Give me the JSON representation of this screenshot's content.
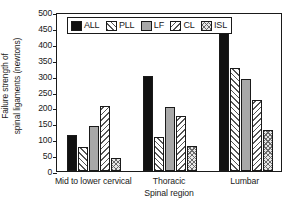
{
  "chart_data": {
    "type": "bar",
    "title": "",
    "xlabel": "Spinal region",
    "ylabel": "Failure strength of spinal ligaments (newtons)",
    "ylabel_lines": [
      "Failure strength of",
      "spinal ligaments (newtons)"
    ],
    "categories": [
      "Mid to lower cervical",
      "Thoracic",
      "Lumbar"
    ],
    "series": [
      {
        "name": "ALL",
        "values": [
          113,
          298,
          450
        ],
        "fill": "solid-black",
        "color": "#111111"
      },
      {
        "name": "PLL",
        "values": [
          75,
          108,
          325
        ],
        "fill": "forward-diagonal-hatch",
        "color": "#ffffff"
      },
      {
        "name": "LF",
        "values": [
          140,
          202,
          288
        ],
        "fill": "solid-gray",
        "color": "#a8a8a8"
      },
      {
        "name": "CL",
        "values": [
          205,
          172,
          224
        ],
        "fill": "backward-diagonal-hatch",
        "color": "#ffffff"
      },
      {
        "name": "ISL",
        "values": [
          40,
          78,
          128
        ],
        "fill": "crosshatch",
        "color": "#e6e6e6"
      }
    ],
    "ylim": [
      0,
      500
    ],
    "yticks": [
      0,
      50,
      100,
      150,
      200,
      250,
      300,
      350,
      400,
      450,
      500
    ],
    "ytick_labels": [
      "0",
      "50",
      "100",
      "150",
      "200",
      "250",
      "300",
      "350",
      "400",
      "450",
      "500"
    ],
    "grid": false,
    "legend_position": "upper-left-inside",
    "legend_entries": [
      "ALL",
      "PLL",
      "LF",
      "CL",
      "ISL"
    ]
  }
}
